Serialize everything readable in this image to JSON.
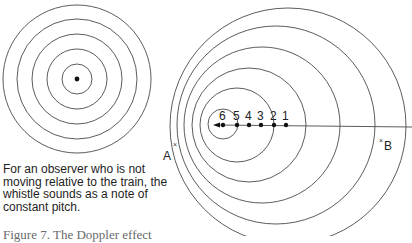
{
  "stationary_panel": {
    "source_dot": {
      "cx": 77,
      "cy": 79
    },
    "wavefront_radii": [
      15,
      30,
      45,
      60,
      74
    ],
    "description": "For an observer who is not moving relative to the train, the whistle sounds as a note of constant pitch."
  },
  "moving_panel": {
    "positions": [
      {
        "label": "1",
        "x": 286
      },
      {
        "label": "2",
        "x": 274
      },
      {
        "label": "3",
        "x": 261
      },
      {
        "label": "4",
        "x": 249
      },
      {
        "label": "5",
        "x": 237
      },
      {
        "label": "6",
        "x": 223
      }
    ],
    "track_y": 125,
    "wavefronts": [
      {
        "cx": 223,
        "r": 15
      },
      {
        "cx": 237,
        "r": 37
      },
      {
        "cx": 249,
        "r": 57
      },
      {
        "cx": 262,
        "r": 78
      },
      {
        "cx": 276,
        "r": 99
      },
      {
        "cx": 288,
        "r": 118
      }
    ],
    "observer_a": {
      "label": "A",
      "mark": "×"
    },
    "observer_b": {
      "label": "B",
      "mark": "×"
    },
    "direction": "left"
  },
  "caption": "Figure 7. The Doppler effect"
}
